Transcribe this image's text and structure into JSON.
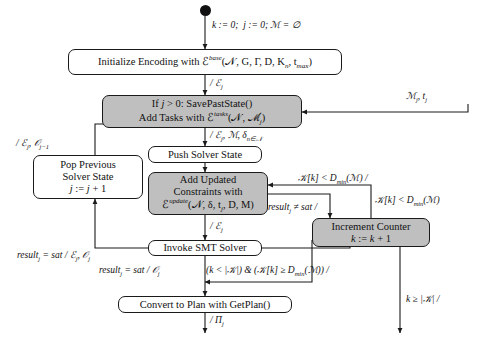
{
  "diagram": {
    "type": "flowchart",
    "background": "#ffffff",
    "stroke_color": "#1a1a1a",
    "shaded_fill": "#bfbfbf",
    "start_node": "filled-circle"
  },
  "nodes": [
    {
      "id": "initialize",
      "shaded": false,
      "lines": [
        "Initialize Encoding with &#x2130;<sup class=\"sup\">base</sup>(&#x1D4A9;, G, &#x393;, D, K<sub class=\"sub\">n</sub>, t<sub class=\"sub\">max</sub>)"
      ],
      "plain": "Initialize Encoding with E^base(N, G, Gamma, D, K_n, t_max)"
    },
    {
      "id": "save-past-state",
      "shaded": true,
      "lines": [
        "If <i class=\"v\">j</i> &gt; 0: SavePastState()",
        "Add Tasks with &#x2130;<sup class=\"sup\">tasks</sup>(&#x1D4A9;, &#x2133;<sub class=\"sub\">j</sub>)"
      ],
      "plain": "If j > 0: SavePastState() / Add Tasks with E^tasks(N, M_j)"
    },
    {
      "id": "pop-previous-solver-state",
      "shaded": false,
      "lines": [
        "Pop Previous",
        "Solver State",
        "<i class=\"v\">j</i> := <i class=\"v\">j</i> + 1"
      ],
      "plain": "Pop Previous Solver State j := j + 1"
    },
    {
      "id": "push-solver-state",
      "shaded": false,
      "lines": [
        "Push Solver State"
      ],
      "plain": "Push Solver State"
    },
    {
      "id": "add-updated-constraints",
      "shaded": true,
      "lines": [
        "Add Updated",
        "Constraints with",
        "&#x2130;<sup class=\"sup\">update</sup>(&#x1D4A9;, &#x3B4;, t<sub class=\"sub\">j</sub>, D, M)"
      ],
      "plain": "Add Updated Constraints with E^update(N, delta, t_j, D, M)"
    },
    {
      "id": "invoke-smt-solver",
      "shaded": false,
      "lines": [
        "Invoke SMT Solver"
      ],
      "plain": "Invoke SMT Solver"
    },
    {
      "id": "increment-counter",
      "shaded": true,
      "lines": [
        "Increment Counter",
        "<i class=\"v\">k</i> := <i class=\"v\">k</i> + 1"
      ],
      "plain": "Increment Counter k := k + 1"
    },
    {
      "id": "convert-to-plan",
      "shaded": false,
      "lines": [
        "Convert to Plan with GetPlan()"
      ],
      "plain": "Convert to Plan with GetPlan()"
    }
  ],
  "edge_labels": [
    {
      "id": "init-guard",
      "text": "<i class=\"v\">k</i> := 0;&nbsp; <i class=\"v\">j</i> := 0; &#x2133; = &#x2205;",
      "plain": "k := 0;  j := 0; M = 0 (empty set)"
    },
    {
      "id": "encoding-out",
      "text": "/ &#x2130;<sub class=\"sub\">j</sub>",
      "plain": "/ E_j"
    },
    {
      "id": "tasks-input",
      "text": "&#x2133;<sub class=\"sub\">j</sub>, t<sub class=\"sub\">j</sub>",
      "plain": "M_j, t_j"
    },
    {
      "id": "save-out",
      "text": "/ &#x2130;<sub class=\"sub\">j</sub>, &#x2133;, &#x3B4;<sub class=\"sub\">n&#x2208;&#x1D4A9;</sub>",
      "plain": "/ E_j, M, delta_{n in N}"
    },
    {
      "id": "pop-in",
      "text": "/ &#x2130;<sub class=\"sub\">j</sub>, &#x1D4AA;<sub class=\"sub\">j&#x2212;1</sub>",
      "plain": "/ E_j, O_{j-1}"
    },
    {
      "id": "update-out",
      "text": "/ &#x2130;<sub class=\"sub\">j</sub>",
      "plain": "/ E_j"
    },
    {
      "id": "kmin-top",
      "text": "&#x1D4A6;[<i class=\"v\">k</i>] &lt; D<sub class=\"sub\">min</sub>(&#x2133;) /",
      "plain": "K[k] < D_min(M) /"
    },
    {
      "id": "kmin-right",
      "text": "&#x1D4A6;[<i class=\"v\">k</i>] &lt; D<sub class=\"sub\">min</sub>(&#x2133;)",
      "plain": "K[k] < D_min(M)"
    },
    {
      "id": "result-notsat",
      "text": "result<sub class=\"sub\">j</sub> &#x2260; sat /",
      "plain": "result_j != sat /"
    },
    {
      "id": "result-sat-eo",
      "text": "result<sub class=\"sub\">j</sub> = sat / &#x2130;<sub class=\"sub\">j</sub>, &#x1D4AA;<sub class=\"sub\">j</sub>",
      "plain": "result_j = sat / E_j, O_j"
    },
    {
      "id": "result-sat-o",
      "text": "result<sub class=\"sub\">j</sub> = sat / &#x1D4AA;<sub class=\"sub\">j</sub>",
      "plain": "result_j = sat / O_j"
    },
    {
      "id": "counter-guard",
      "text": "(<i class=\"v\">k</i> &lt; |&#x1D4A6;|) &amp; (&#x1D4A6;[<i class=\"v\">k</i>] &#x2265; D<sub class=\"sub\">min</sub>(&#x2133;)) /",
      "plain": "(k < |K|) & (K[k] >= D_min(M)) /"
    },
    {
      "id": "k-exhausted",
      "text": "<i class=\"v\">k</i> &#x2265; |&#x1D4A6;| /",
      "plain": "k >= |K| /"
    },
    {
      "id": "plan-out",
      "text": "/ &#x3A0;<sub class=\"sub\">j</sub>",
      "plain": "/ Pi_j"
    }
  ]
}
